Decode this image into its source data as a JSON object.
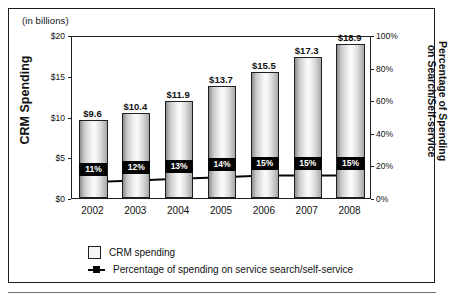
{
  "figure": {
    "units_note": "(in billions)"
  },
  "chart_data": {
    "type": "bar",
    "title": "",
    "subtitle": "(in billions)",
    "categories": [
      "2002",
      "2003",
      "2004",
      "2005",
      "2006",
      "2007",
      "2008"
    ],
    "xlabel": "",
    "ylabel": "CRM Spending",
    "ylabel_right": "Percentage of Spending on Search/Self-service",
    "ylim": [
      0,
      20
    ],
    "ylim_right": [
      0,
      100
    ],
    "grid": false,
    "legend_position": "bottom",
    "series": [
      {
        "name": "CRM spending",
        "type": "bar",
        "axis": "left",
        "values": [
          9.6,
          10.4,
          11.9,
          13.7,
          15.5,
          17.3,
          18.9
        ],
        "data_labels": [
          "$9.6",
          "$10.4",
          "$11.9",
          "$13.7",
          "$15.5",
          "$17.3",
          "$18.9"
        ]
      },
      {
        "name": "Percentage of spending on service search/self-service",
        "type": "line",
        "axis": "right",
        "values": [
          11,
          12,
          13,
          14,
          15,
          15,
          15
        ],
        "data_labels": [
          "11%",
          "12%",
          "13%",
          "14%",
          "15%",
          "15%",
          "15%"
        ]
      }
    ],
    "yticks_left": [
      "$0",
      "$5",
      "$10",
      "$15",
      "$20"
    ],
    "yticks_left_values": [
      0,
      5,
      10,
      15,
      20
    ],
    "yticks_right": [
      "0%",
      "20%",
      "40%",
      "60%",
      "80%",
      "100%"
    ],
    "yticks_right_values": [
      0,
      20,
      40,
      60,
      80,
      100
    ]
  },
  "axes": {
    "left_title": "CRM Spending",
    "right_title_line1": "Percentage of Spending",
    "right_title_line2": "on Search/Self-service"
  },
  "legend": {
    "items": [
      {
        "label": "CRM spending",
        "marker": "square-outline",
        "color": "#f4f4f4"
      },
      {
        "label": "Percentage of spending on service search/self-service",
        "marker": "line-square",
        "color": "#050505"
      }
    ]
  },
  "colors": {
    "frame": "#1a1a1a",
    "axis": "#1f1f1f",
    "line_series": "#050505",
    "label_box_bg": "#050505",
    "label_box_text": "#ffffff",
    "text": "#111111"
  }
}
